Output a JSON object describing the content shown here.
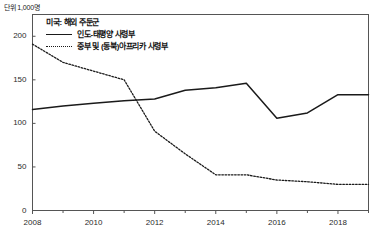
{
  "unit_note": "단위 1,000명",
  "legend": {
    "title": "미국: 해외 주둔군",
    "entries": [
      {
        "label": "인도-태평양 사령부",
        "style": "solid"
      },
      {
        "label": "중부 및 (동북)아프리카 사령부",
        "style": "dotted"
      }
    ]
  },
  "axes": {
    "y_ticks": [
      "0",
      "50",
      "100",
      "150",
      "200"
    ],
    "x_ticks": [
      "2008",
      "2010",
      "2012",
      "2014",
      "2016",
      "2018"
    ]
  },
  "colors": {
    "line": "#1a1a1a",
    "axis": "#555555",
    "background": "#ffffff"
  },
  "chart_data": {
    "type": "line",
    "title": "미국: 해외 주둔군",
    "subtitle": "",
    "xlabel": "",
    "ylabel": "",
    "unit": "단위 1,000명",
    "grid": false,
    "legend_position": "top-left",
    "x": [
      2008,
      2009,
      2010,
      2011,
      2012,
      2013,
      2014,
      2015,
      2016,
      2017,
      2018,
      2019
    ],
    "xlim": [
      2008,
      2019
    ],
    "ylim": [
      0,
      225
    ],
    "y_ticks": [
      0,
      50,
      100,
      150,
      200
    ],
    "x_ticks": [
      2008,
      2010,
      2012,
      2014,
      2016,
      2018
    ],
    "x_minor_ticks": [
      2009,
      2011,
      2013,
      2015,
      2017,
      2019
    ],
    "series": [
      {
        "name": "인도-태평양 사령부",
        "style": "solid",
        "values": [
          116,
          120,
          123,
          126,
          128,
          138,
          141,
          146,
          106,
          112,
          133,
          133
        ]
      },
      {
        "name": "중부 및 (동북)아프리카 사령부",
        "style": "dotted",
        "values": [
          191,
          170,
          160,
          150,
          91,
          65,
          41,
          41,
          35,
          33,
          30,
          30
        ]
      }
    ]
  }
}
